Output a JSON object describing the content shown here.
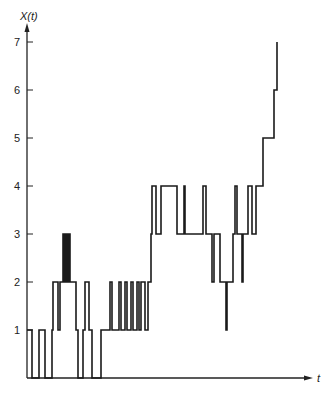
{
  "chart_data": {
    "type": "line",
    "step": true,
    "title": "",
    "xlabel": "t",
    "ylabel": "X(t)",
    "ylim": [
      0,
      7
    ],
    "yticks": [
      1,
      2,
      3,
      4,
      5,
      6,
      7
    ],
    "grid": false,
    "legend": null,
    "note": "Sample path of a step process (random walk / birth-death). x values are approximate pixel-proportional times; y values are integer states.",
    "series": [
      {
        "name": "X(t)",
        "points": [
          [
            0,
            1
          ],
          [
            5,
            0
          ],
          [
            12,
            1
          ],
          [
            18,
            0
          ],
          [
            25,
            1
          ],
          [
            26,
            2
          ],
          [
            31,
            1
          ],
          [
            33,
            2
          ],
          [
            36,
            3
          ],
          [
            37,
            2
          ],
          [
            38,
            3
          ],
          [
            39,
            2
          ],
          [
            40,
            3
          ],
          [
            41,
            2
          ],
          [
            42,
            3
          ],
          [
            43,
            2
          ],
          [
            49,
            1
          ],
          [
            51,
            0
          ],
          [
            56,
            1
          ],
          [
            58,
            2
          ],
          [
            62,
            1
          ],
          [
            65,
            0
          ],
          [
            74,
            1
          ],
          [
            83,
            2
          ],
          [
            85,
            1
          ],
          [
            92,
            2
          ],
          [
            94,
            1
          ],
          [
            98,
            2
          ],
          [
            100,
            1
          ],
          [
            104,
            2
          ],
          [
            106,
            1
          ],
          [
            110,
            2
          ],
          [
            112,
            1
          ],
          [
            114,
            2
          ],
          [
            118,
            1
          ],
          [
            121,
            2
          ],
          [
            124,
            3
          ],
          [
            125,
            4
          ],
          [
            129,
            3
          ],
          [
            134,
            4
          ],
          [
            150,
            3
          ],
          [
            157,
            4
          ],
          [
            158,
            3
          ],
          [
            176,
            4
          ],
          [
            179,
            3
          ],
          [
            185,
            2
          ],
          [
            187,
            3
          ],
          [
            193,
            2
          ],
          [
            199,
            1
          ],
          [
            200,
            2
          ],
          [
            206,
            3
          ],
          [
            208,
            4
          ],
          [
            210,
            3
          ],
          [
            215,
            2
          ],
          [
            216,
            3
          ],
          [
            221,
            4
          ],
          [
            225,
            3
          ],
          [
            229,
            4
          ],
          [
            236,
            5
          ],
          [
            247,
            6
          ],
          [
            250,
            7
          ]
        ]
      }
    ]
  },
  "axes": {
    "y_title": "X(t)",
    "x_title": "t",
    "y_tick_labels": [
      "1",
      "2",
      "3",
      "4",
      "5",
      "6",
      "7"
    ]
  }
}
